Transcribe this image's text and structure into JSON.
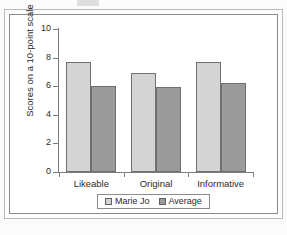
{
  "chart_data": {
    "type": "bar",
    "title": "",
    "subtitle": "",
    "xlabel": "",
    "ylabel": "Scores on a 10-point scale",
    "categories": [
      "Likeable",
      "Original",
      "Informative"
    ],
    "series": [
      {
        "name": "Marie Jo",
        "color": "#d4d4d4",
        "values": [
          7.7,
          6.9,
          7.7
        ]
      },
      {
        "name": "Average",
        "color": "#9b9b9b",
        "values": [
          6.0,
          5.95,
          6.25
        ]
      }
    ],
    "ylim": [
      0,
      10
    ],
    "yticks": [
      0,
      2,
      4,
      6,
      8,
      10
    ],
    "ytick_labels": [
      "0",
      "2",
      "4",
      "6",
      "8",
      "10"
    ],
    "grid": false,
    "legend_position": "bottom-center",
    "axis_color": "#7d7d7d",
    "bar_edge_color": "#6f6f6f",
    "background": "#ffffff"
  },
  "figure": {
    "frame_border_color": "#8c8c8c",
    "outer_border_color": "#b9b9b9"
  }
}
